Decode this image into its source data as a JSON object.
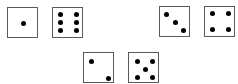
{
  "figure": {
    "border_color": "#5a5a5a",
    "pip_color": "#000000",
    "background": "#ffffff"
  },
  "dice": [
    {
      "value": 1,
      "x": 7,
      "y": 7,
      "pips": [
        [
          15,
          15
        ]
      ]
    },
    {
      "value": 6,
      "x": 52,
      "y": 7,
      "pips": [
        [
          7,
          6
        ],
        [
          23,
          6
        ],
        [
          7,
          14
        ],
        [
          23,
          14
        ],
        [
          7,
          22
        ],
        [
          23,
          22
        ]
      ]
    },
    {
      "value": 3,
      "x": 159,
      "y": 6,
      "pips": [
        [
          6,
          7
        ],
        [
          15,
          15
        ],
        [
          23,
          23
        ]
      ]
    },
    {
      "value": 4,
      "x": 204,
      "y": 6,
      "pips": [
        [
          7,
          6
        ],
        [
          23,
          6
        ],
        [
          7,
          22
        ],
        [
          23,
          22
        ]
      ]
    },
    {
      "value": 2,
      "x": 83,
      "y": 52,
      "pips": [
        [
          7,
          8
        ],
        [
          24,
          25
        ]
      ]
    },
    {
      "value": 5,
      "x": 128,
      "y": 52,
      "pips": [
        [
          8,
          8
        ],
        [
          23,
          8
        ],
        [
          16,
          16
        ],
        [
          8,
          24
        ],
        [
          23,
          24
        ]
      ]
    }
  ]
}
